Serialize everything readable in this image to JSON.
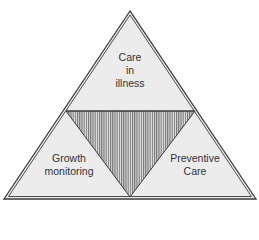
{
  "diagram": {
    "type": "triangle-segmented",
    "colors": {
      "outline": "#3a3a3a",
      "fill": "#ececec",
      "hatch": "#555555",
      "text": "#333333"
    },
    "sections": {
      "top": {
        "lines": [
          "Care",
          "in",
          "illness"
        ]
      },
      "bottom_left": {
        "lines": [
          "Growth",
          "monitoring"
        ]
      },
      "bottom_right": {
        "lines": [
          "Preventive",
          "Care"
        ]
      },
      "center": {
        "pattern": "vertical-hatch"
      }
    }
  }
}
